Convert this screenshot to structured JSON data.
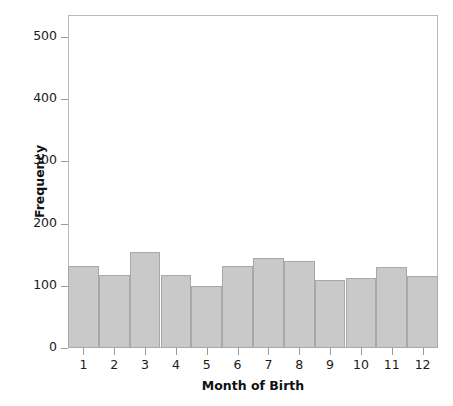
{
  "chart_data": {
    "type": "bar",
    "title": "",
    "subtitle": "",
    "xlabel": "Month of Birth",
    "ylabel": "Frequency",
    "categories": [
      "1",
      "2",
      "3",
      "4",
      "5",
      "6",
      "7",
      "8",
      "9",
      "10",
      "11",
      "12"
    ],
    "values": [
      132,
      118,
      154,
      117,
      100,
      132,
      144,
      139,
      110,
      112,
      130,
      116
    ],
    "series": [
      {
        "name": "Frequency",
        "values": [
          132,
          118,
          154,
          117,
          100,
          132,
          144,
          139,
          110,
          112,
          130,
          116
        ]
      }
    ],
    "ylim": [
      0,
      535
    ],
    "xlim": [
      0.5,
      12.5
    ],
    "yticks": [
      0,
      100,
      200,
      300,
      400,
      500
    ],
    "ytick_labels": [
      "0",
      "100",
      "200",
      "300",
      "400",
      "500"
    ],
    "xtick_labels": [
      "1",
      "2",
      "3",
      "4",
      "5",
      "6",
      "7",
      "8",
      "9",
      "10",
      "11",
      "12"
    ],
    "grid": false,
    "legend": false,
    "legend_position": "none",
    "bar_color": "#c9c9c9",
    "bar_edge_color": "#a8a8a8",
    "frame_color": "#b9b9b9",
    "background_color": "#ffffff",
    "text_color": "#1a1a1a",
    "annotations": []
  },
  "axes": {
    "y_title": "Frequency",
    "x_title": "Month of Birth"
  }
}
